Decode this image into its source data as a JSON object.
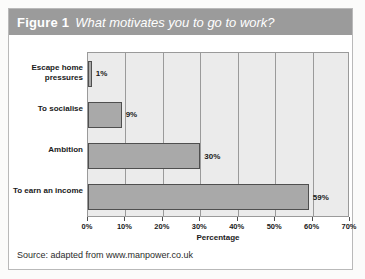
{
  "figure": {
    "number_label": "Figure 1",
    "title": "What motivates you to go to work?",
    "source": "Source: adapted from www.manpower.co.uk",
    "header_bg": "#9b9b9b",
    "bar_fill": "#a9a9a9",
    "plot_bg": "#ebebeb"
  },
  "chart_data": {
    "type": "bar",
    "orientation": "horizontal",
    "title": "What motivates you to go to work?",
    "categories": [
      "Escape home pressures",
      "To socialise",
      "Ambition",
      "To earn an income"
    ],
    "values": [
      1,
      9,
      30,
      59
    ],
    "value_labels": [
      "1%",
      "9%",
      "30%",
      "59%"
    ],
    "xlabel": "Percentage",
    "ylabel": "",
    "xlim": [
      0,
      70
    ],
    "xticks": [
      0,
      10,
      20,
      30,
      40,
      50,
      60,
      70
    ],
    "xtick_labels": [
      "0%",
      "10%",
      "20%",
      "30%",
      "40%",
      "50%",
      "60%",
      "70%"
    ],
    "grid": "vertical",
    "legend": null,
    "series": [
      {
        "name": "Percentage",
        "values": [
          1,
          9,
          30,
          59
        ]
      }
    ]
  }
}
